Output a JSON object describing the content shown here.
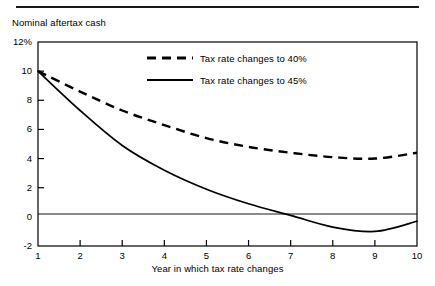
{
  "figure": {
    "top_rule": true,
    "ylabel": "Nominal aftertax cash",
    "xlabel": "Year in which tax rate changes"
  },
  "legend": {
    "entries": [
      {
        "label": "Tax rate changes to 40%",
        "style": "dashed",
        "color": "#000000"
      },
      {
        "label": "Tax rate changes to 45%",
        "style": "solid",
        "color": "#000000"
      }
    ]
  },
  "chart_data": {
    "type": "line",
    "title": "",
    "subtitle": "",
    "xlabel": "Year in which tax rate changes",
    "ylabel": "Nominal aftertax cash",
    "x": [
      1,
      2,
      3,
      4,
      5,
      6,
      7,
      8,
      9,
      10
    ],
    "xlim": [
      1,
      10
    ],
    "ylim": [
      -2,
      12
    ],
    "yticks": [
      -2,
      0,
      2,
      4,
      6,
      8,
      10,
      12
    ],
    "ytick_labels": [
      "-2",
      "0",
      "2",
      "4",
      "6",
      "8",
      "10",
      "12%"
    ],
    "xticks": [
      1,
      2,
      3,
      4,
      5,
      6,
      7,
      8,
      9,
      10
    ],
    "xtick_labels": [
      "1",
      "2",
      "3",
      "4",
      "5",
      "6",
      "7",
      "8",
      "9",
      "10"
    ],
    "grid": false,
    "zero_line": true,
    "legend_position": "upper-right-inside",
    "series": [
      {
        "name": "Tax rate changes to 40%",
        "style": "dashed",
        "color": "#000000",
        "values": [
          10.0,
          8.6,
          7.3,
          6.3,
          5.4,
          4.8,
          4.4,
          4.1,
          4.0,
          4.4
        ]
      },
      {
        "name": "Tax rate changes to 45%",
        "style": "solid",
        "color": "#000000",
        "values": [
          10.0,
          7.3,
          4.9,
          3.2,
          1.9,
          0.9,
          0.1,
          -0.7,
          -1.0,
          -0.3
        ]
      }
    ]
  }
}
